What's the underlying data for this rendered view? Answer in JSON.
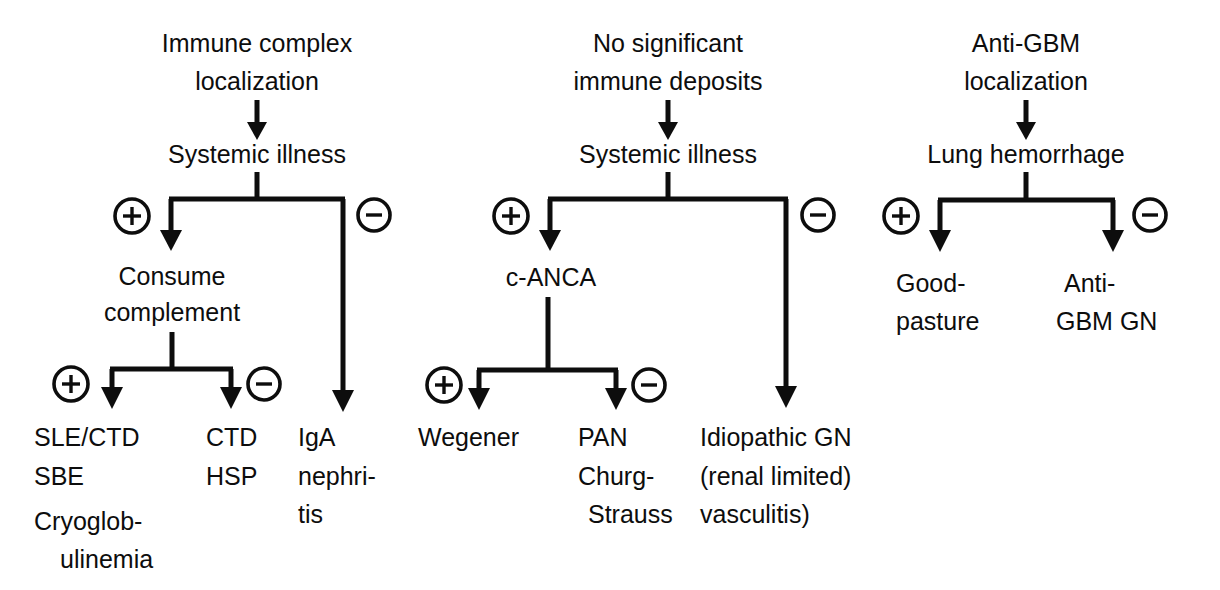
{
  "figure": {
    "type": "flowchart",
    "orientation": "top-down",
    "columns": 3,
    "background_color": "#ffffff",
    "ink_color": "#0d0d0d"
  },
  "columns": [
    {
      "id": "immune-complex",
      "title_line1": "Immune complex",
      "title_line2": "localization",
      "step": "Systemic illness",
      "branch_positive_sign": "+",
      "branch_negative_sign": "-",
      "positive_node_line1": "Consume",
      "positive_node_line2": "complement",
      "sub_positive_sign": "+",
      "sub_negative_sign": "-",
      "leaves": [
        {
          "id": "sle-ctd-sbe-cryo",
          "lines": [
            "SLE/CTD",
            "SBE",
            "Cryoglob-",
            "ulinemia"
          ],
          "indents": [
            0,
            0,
            0,
            1
          ]
        },
        {
          "id": "ctd-hsp",
          "lines": [
            "CTD",
            "HSP"
          ],
          "indents": [
            0,
            0
          ]
        },
        {
          "id": "iga-nephritis",
          "lines": [
            "IgA",
            "nephri-",
            "tis"
          ],
          "indents": [
            0,
            0,
            0
          ]
        }
      ]
    },
    {
      "id": "pauci-immune",
      "title_line1": "No significant",
      "title_line2": "immune deposits",
      "step": "Systemic illness",
      "branch_positive_sign": "+",
      "branch_negative_sign": "-",
      "positive_node_line1": "c-ANCA",
      "positive_node_line2": "",
      "sub_positive_sign": "+",
      "sub_negative_sign": "-",
      "leaves": [
        {
          "id": "wegener",
          "lines": [
            "Wegener"
          ],
          "indents": [
            0
          ]
        },
        {
          "id": "pan-churg-strauss",
          "lines": [
            "PAN",
            "Churg-",
            "Strauss"
          ],
          "indents": [
            0,
            0,
            1
          ]
        },
        {
          "id": "idiopathic-gn",
          "lines": [
            "Idiopathic GN",
            "(renal limited)",
            "vasculitis)"
          ],
          "indents": [
            0,
            0,
            0
          ]
        }
      ]
    },
    {
      "id": "anti-gbm",
      "title_line1": "Anti-GBM",
      "title_line2": "localization",
      "step": "Lung hemorrhage",
      "branch_positive_sign": "+",
      "branch_negative_sign": "-",
      "leaves": [
        {
          "id": "goodpasture",
          "lines": [
            "Good-",
            "pasture"
          ],
          "indents": [
            0,
            1
          ]
        },
        {
          "id": "anti-gbm-gn",
          "lines": [
            "Anti-",
            "GBM GN"
          ],
          "indents": [
            0,
            1
          ]
        }
      ]
    }
  ]
}
